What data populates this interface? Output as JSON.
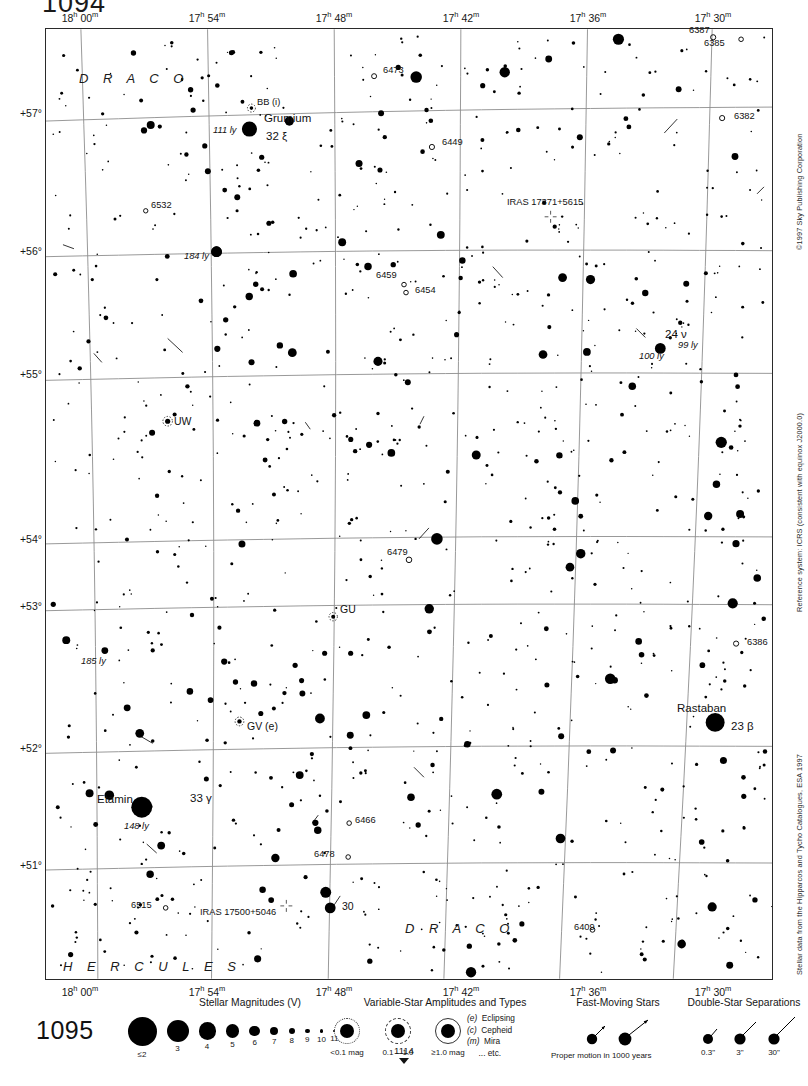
{
  "page": {
    "number_top": "1094",
    "number_bottom_left": "1095",
    "number_bottom_center": "1114"
  },
  "margin_credits": {
    "copyright": "©1997 Sky Publishing Corporation",
    "reference_system": "Reference system: ICRS (consistent with equinox J2000.0)",
    "data_source": "Stellar data from the Hipparcos and Tycho Catalogues, ESA 1997"
  },
  "axes": {
    "ra_top": [
      "18ʰ 00ᵐ",
      "17ʰ 54ᵐ",
      "17ʰ 48ᵐ",
      "17ʰ 42ᵐ",
      "17ʰ 36ᵐ",
      "17ʰ 30ᵐ"
    ],
    "ra_bottom": [
      "18ʰ 00ᵐ",
      "17ʰ 54ᵐ",
      "17ʰ 48ᵐ",
      "17ʰ 42ᵐ",
      "17ʰ 36ᵐ",
      "17ʰ 30ᵐ"
    ],
    "dec_left": [
      "+57°",
      "+56°",
      "+55°",
      "+54°",
      "+53°",
      "+52°",
      "+51°"
    ]
  },
  "constellations": [
    {
      "name": "D R A C O",
      "x": 78,
      "y": 78
    },
    {
      "name": "D R A C O",
      "x": 404,
      "y": 928
    },
    {
      "name": "H E R C U L E S",
      "x": 62,
      "y": 966
    }
  ],
  "labels": [
    {
      "text": "6387",
      "x": 688,
      "y": 31,
      "cls": "small"
    },
    {
      "text": "6385",
      "x": 703,
      "y": 44,
      "cls": "small"
    },
    {
      "text": "6473",
      "x": 382,
      "y": 71,
      "cls": "small"
    },
    {
      "text": "BB (i)",
      "x": 256,
      "y": 103,
      "cls": "small"
    },
    {
      "text": "6382",
      "x": 733,
      "y": 117,
      "cls": "small"
    },
    {
      "text": "Grumium",
      "x": 263,
      "y": 118,
      "cls": "named"
    },
    {
      "text": "111 ly",
      "x": 212,
      "y": 131,
      "cls": "ital"
    },
    {
      "text": "32 ξ",
      "x": 265,
      "y": 136,
      "cls": "named"
    },
    {
      "text": "6449",
      "x": 441,
      "y": 143,
      "cls": "small"
    },
    {
      "text": "IRAS 17371+5615",
      "x": 506,
      "y": 203,
      "cls": "small"
    },
    {
      "text": "6532",
      "x": 150,
      "y": 206,
      "cls": "small"
    },
    {
      "text": "184 ly",
      "x": 183,
      "y": 257,
      "cls": "ital"
    },
    {
      "text": "6459",
      "x": 375,
      "y": 276,
      "cls": "small"
    },
    {
      "text": "6454",
      "x": 414,
      "y": 291,
      "cls": "small"
    },
    {
      "text": "24 ν",
      "x": 664,
      "y": 334,
      "cls": "named"
    },
    {
      "text": "99 ly",
      "x": 677,
      "y": 346,
      "cls": "ital"
    },
    {
      "text": "100 ly",
      "x": 638,
      "y": 357,
      "cls": "ital"
    },
    {
      "text": "UW",
      "x": 173,
      "y": 421,
      "cls": ""
    },
    {
      "text": "6479",
      "x": 386,
      "y": 553,
      "cls": "small"
    },
    {
      "text": "GU",
      "x": 339,
      "y": 609,
      "cls": ""
    },
    {
      "text": "6386",
      "x": 746,
      "y": 643,
      "cls": "small"
    },
    {
      "text": "185 ly",
      "x": 80,
      "y": 662,
      "cls": "ital"
    },
    {
      "text": "Rastaban",
      "x": 676,
      "y": 708,
      "cls": "named"
    },
    {
      "text": "GV (e)",
      "x": 246,
      "y": 726,
      "cls": ""
    },
    {
      "text": "23 β",
      "x": 730,
      "y": 726,
      "cls": "named"
    },
    {
      "text": "Etamin",
      "x": 96,
      "y": 799,
      "cls": "named"
    },
    {
      "text": "33 γ",
      "x": 189,
      "y": 798,
      "cls": "named"
    },
    {
      "text": "6466",
      "x": 354,
      "y": 821,
      "cls": "small"
    },
    {
      "text": "148 ly",
      "x": 123,
      "y": 827,
      "cls": "ital"
    },
    {
      "text": "6478",
      "x": 313,
      "y": 855,
      "cls": "small"
    },
    {
      "text": "6515",
      "x": 130,
      "y": 906,
      "cls": "small"
    },
    {
      "text": "IRAS 17500+5046",
      "x": 199,
      "y": 913,
      "cls": "small"
    },
    {
      "text": "30",
      "x": 341,
      "y": 906,
      "cls": ""
    },
    {
      "text": "6409",
      "x": 573,
      "y": 928,
      "cls": "small"
    }
  ],
  "legend": {
    "magnitudes": {
      "title": "Stellar Magnitudes (V)",
      "entries": [
        {
          "label": "≤2",
          "r": 14.5
        },
        {
          "label": "3",
          "r": 11.0
        },
        {
          "label": "4",
          "r": 8.6
        },
        {
          "label": "5",
          "r": 6.8
        },
        {
          "label": "6",
          "r": 5.4
        },
        {
          "label": "7",
          "r": 4.2
        },
        {
          "label": "8",
          "r": 3.2
        },
        {
          "label": "9",
          "r": 2.4
        },
        {
          "label": "10",
          "r": 1.7
        },
        {
          "label": "11",
          "r": 1.2
        }
      ]
    },
    "variables": {
      "title": "Variable-Star Amplitudes and Types",
      "amplitudes": [
        "<0.1 mag",
        "0.1 – 1.0",
        "≥1.0 mag"
      ],
      "types": [
        {
          "code": "(e)",
          "name": "Eclipsing"
        },
        {
          "code": "(c)",
          "name": "Cepheid"
        },
        {
          "code": "(m)",
          "name": "Mira"
        },
        {
          "code": "",
          "name": "... etc."
        }
      ]
    },
    "fast_moving": {
      "title": "Fast-Moving Stars",
      "caption": "Proper motion in 1000 years"
    },
    "doubles": {
      "title": "Double-Star Separations",
      "separations": [
        "0.3\"",
        "3\"",
        "30\""
      ]
    }
  },
  "chart_data": {
    "type": "scatter",
    "xlabel": "Right Ascension",
    "ylabel": "Declination",
    "xlim": [
      "18h 02m",
      "17h 28m"
    ],
    "ylim": [
      "+50.6°",
      "+57.6°"
    ],
    "grid": true,
    "bright_stars": [
      {
        "name": "Grumium",
        "designation": "32 ξ",
        "distance_ly": 111,
        "mag": 3.6,
        "x": 249,
        "y": 128
      },
      {
        "name": "Etamin",
        "designation": "33 γ",
        "distance_ly": 148,
        "mag": 2.2,
        "x": 141,
        "y": 808
      },
      {
        "name": "Rastaban",
        "designation": "23 β",
        "distance_ly": null,
        "mag": 2.8,
        "x": 716,
        "y": 723
      },
      {
        "name": "24 ν",
        "designation": "24 ν",
        "distance_ly": 99,
        "mag": 4.9,
        "x": 661,
        "y": 348
      },
      {
        "name": "",
        "designation": "30",
        "distance_ly": null,
        "mag": 5.0,
        "x": 330,
        "y": 909
      },
      {
        "name": "",
        "designation": "",
        "distance_ly": 184,
        "mag": 4.8,
        "x": 216,
        "y": 251
      },
      {
        "name": "",
        "designation": "",
        "distance_ly": 185,
        "mag": 6.0,
        "x": 104,
        "y": 651
      }
    ],
    "deep_sky": [
      {
        "id": "6387"
      },
      {
        "id": "6385"
      },
      {
        "id": "6382"
      },
      {
        "id": "6473"
      },
      {
        "id": "6449"
      },
      {
        "id": "6532"
      },
      {
        "id": "6459"
      },
      {
        "id": "6454"
      },
      {
        "id": "6479"
      },
      {
        "id": "6386"
      },
      {
        "id": "6466"
      },
      {
        "id": "6478"
      },
      {
        "id": "6515"
      },
      {
        "id": "6409"
      }
    ],
    "variable_stars": [
      {
        "id": "BB",
        "type": "(i)"
      },
      {
        "id": "UW",
        "type": ""
      },
      {
        "id": "GU",
        "type": ""
      },
      {
        "id": "GV",
        "type": "(e)"
      }
    ],
    "iras_sources": [
      "IRAS 17371+5615",
      "IRAS 17500+5046"
    ]
  }
}
